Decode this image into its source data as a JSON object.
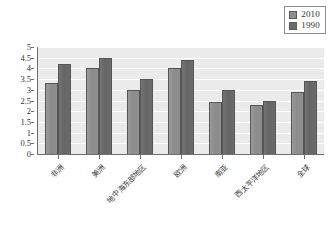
{
  "chart_data": {
    "type": "bar",
    "title": "",
    "subtitle": "",
    "xlabel": "",
    "ylabel": "",
    "ylim": [
      0,
      5
    ],
    "ytick_step": 0.5,
    "yticks": [
      "5",
      "4.5",
      "4",
      "3.5",
      "3",
      "2.5",
      "2",
      "1.5",
      "1",
      "0.5",
      "0"
    ],
    "grid": true,
    "legend_position": "top-right",
    "categories": [
      "非洲",
      "美洲",
      "地中海东部地区",
      "欧洲",
      "南亚",
      "西太平洋地区",
      "全球"
    ],
    "series": [
      {
        "name": "2010",
        "color": "#8e8e8e",
        "values": [
          3.3,
          4.0,
          3.0,
          4.0,
          2.45,
          2.3,
          2.9
        ]
      },
      {
        "name": "1990",
        "color": "#6a6a6a",
        "values": [
          4.2,
          4.5,
          3.5,
          4.4,
          3.0,
          2.5,
          3.4
        ]
      }
    ]
  },
  "legend": {
    "entries": [
      {
        "label": "2010",
        "swatch": "legend-swatch-2010"
      },
      {
        "label": "1990",
        "swatch": "legend-swatch-1990"
      }
    ]
  },
  "colors": {
    "series_2010": "#8e8e8e",
    "series_1990": "#6a6a6a",
    "plot_background": "#ebebeb",
    "gridline": "#ffffff",
    "axis": "#6e6e6e",
    "text": "#333333"
  }
}
